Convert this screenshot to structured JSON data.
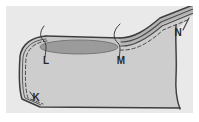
{
  "figure": {
    "canvas": {
      "width": 199,
      "height": 122
    },
    "panel": {
      "x": 6,
      "y": 6,
      "width": 187,
      "height": 107,
      "background_color": "#e9e9e9"
    },
    "colors": {
      "page_background": "#ffffff",
      "panel_background": "#e9e9e9",
      "body_fill": "#cdcdcd",
      "body_fill_upper": "#c6c6c6",
      "lesion_fill": "#9b9b9b",
      "ridge_fill": "#b4b4b4",
      "outline": "#3d3d3d",
      "dashed_line": "#4a4a4a",
      "leader_line": "#3d3d3d",
      "label_text": "#2a2a2a"
    },
    "labels": [
      {
        "id": "label-k",
        "text": "K",
        "x": 36,
        "y": 100,
        "has_leader": false,
        "region": "lower-left margin"
      },
      {
        "id": "label-l",
        "text": "L",
        "x": 47,
        "y": 63,
        "has_leader": true,
        "region": "left end of ellipse"
      },
      {
        "id": "label-m",
        "text": "M",
        "x": 122,
        "y": 63,
        "has_leader": true,
        "region": "right end of ellipse"
      },
      {
        "id": "label-n",
        "text": "N",
        "x": 178,
        "y": 35,
        "has_leader": false,
        "region": "right ridge crest"
      }
    ],
    "features": [
      {
        "name": "outer-outline",
        "style": "solid",
        "color": "#3d3d3d"
      },
      {
        "name": "inner-dashed-contour",
        "style": "dashed",
        "color": "#4a4a4a"
      },
      {
        "name": "dark-ellipse-lesion",
        "style": "filled",
        "color": "#9b9b9b"
      },
      {
        "name": "right-ridge-band",
        "style": "filled-with-parallel-lines",
        "color": "#b4b4b4"
      },
      {
        "name": "leader-line-l",
        "style": "hooked-curve"
      },
      {
        "name": "leader-line-m",
        "style": "hooked-curve"
      }
    ]
  }
}
